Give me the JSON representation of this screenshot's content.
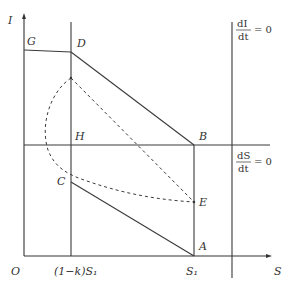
{
  "diagram": {
    "axes": {
      "y_label": "I",
      "x_label": "S",
      "origin_label": "O"
    },
    "x_ticks": {
      "left": "(1−k)S₁",
      "right": "S₁"
    },
    "points": {
      "G": "G",
      "D": "D",
      "H": "H",
      "C": "C",
      "B": "B",
      "E": "E",
      "A": "A"
    },
    "nullclines": {
      "dI": {
        "numerator": "dI",
        "denominator": "dt",
        "equals": "= 0"
      },
      "dS": {
        "numerator": "dS",
        "denominator": "dt",
        "equals": "= 0"
      }
    },
    "colors": {
      "line": "#3a3a3a",
      "background": "#ffffff"
    }
  }
}
